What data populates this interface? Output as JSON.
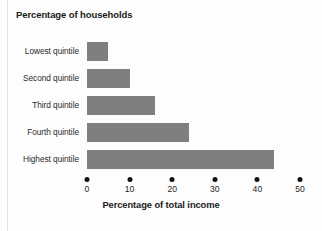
{
  "figure": {
    "title": "Percentage of households",
    "x_axis_title": "Percentage of total income",
    "bar_color": "#7f7f7f",
    "text_color": "#1f1f1f"
  },
  "chart_data": {
    "type": "bar",
    "orientation": "horizontal",
    "title": "Percentage of households",
    "xlabel": "Percentage of total income",
    "ylabel": "Percentage of households",
    "categories": [
      "Lowest quintile",
      "Second quintile",
      "Third quintile",
      "Fourth quintile",
      "Highest quintile"
    ],
    "values": [
      5,
      10,
      16,
      24,
      44
    ],
    "xlim": [
      0,
      50
    ],
    "xticks": [
      0,
      10,
      20,
      30,
      40,
      50
    ],
    "xtick_labels": [
      "0",
      "10",
      "20",
      "30",
      "40",
      "50"
    ],
    "tick_marker": "filled-circle",
    "grid": false,
    "legend": false
  }
}
